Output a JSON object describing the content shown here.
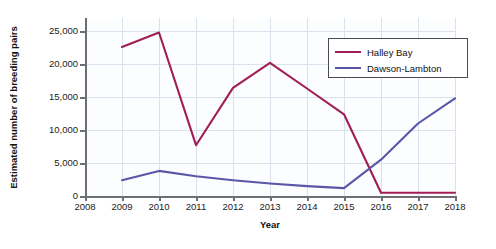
{
  "chart_data": {
    "type": "line",
    "title": "",
    "xlabel": "Year",
    "ylabel": "Estimated number of breeding pairs",
    "x": [
      2009,
      2010,
      2011,
      2012,
      2013,
      2014,
      2015,
      2016,
      2017,
      2018
    ],
    "xtick_labels": [
      "2008",
      "2009",
      "2010",
      "2011",
      "2012",
      "2013",
      "2014",
      "2015",
      "2016",
      "2017",
      "2018"
    ],
    "ytick_labels": [
      "0",
      "5,000",
      "10,000",
      "15,000",
      "20,000",
      "25,000"
    ],
    "ytick_values": [
      0,
      5000,
      10000,
      15000,
      20000,
      25000
    ],
    "xlim": [
      2008,
      2018
    ],
    "ylim": [
      0,
      27000
    ],
    "grid": true,
    "legend_position": "upper-right",
    "series": [
      {
        "name": "Halley Bay",
        "color": "#a01e56",
        "values": [
          22600,
          24800,
          7700,
          16400,
          20200,
          16300,
          12400,
          500,
          500,
          500
        ]
      },
      {
        "name": "Dawson-Lambton",
        "color": "#5a56a8",
        "values": [
          2400,
          3800,
          3000,
          2400,
          1900,
          1500,
          1200,
          5500,
          11000,
          14800
        ]
      }
    ]
  },
  "colors": {
    "background": "#ffffff",
    "plot_background": "#fcfdfe",
    "grid": "#d9e2ec",
    "axis": "#6b6f73",
    "text": "#111111"
  }
}
